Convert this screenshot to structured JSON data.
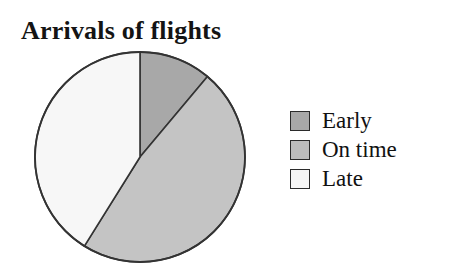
{
  "chart_data": {
    "type": "pie",
    "title": "Arrivals of flights",
    "xlabel": "",
    "ylabel": "",
    "legend_position": "right",
    "grid": false,
    "start_angle_deg": 0,
    "direction": "clockwise",
    "categories": [
      "Early",
      "On time",
      "Late"
    ],
    "values": [
      11,
      48,
      41
    ],
    "units": "percent",
    "slices": [
      {
        "label": "Early",
        "value": 11,
        "start_angle_deg": 0,
        "end_angle_deg": 40,
        "color": "#a8a8a8",
        "swatch_color": "#a8a8a8"
      },
      {
        "label": "On time",
        "value": 48,
        "start_angle_deg": 40,
        "end_angle_deg": 212,
        "color": "#c4c4c4",
        "swatch_color": "#bdbdbd"
      },
      {
        "label": "Late",
        "value": 41,
        "start_angle_deg": 212,
        "end_angle_deg": 360,
        "color": "#f7f7f7",
        "swatch_color": "#f5f5f5"
      }
    ],
    "outline_color": "#333333"
  },
  "title": {
    "text": "Arrivals of flights"
  },
  "legend": {
    "items": [
      {
        "label": "Early",
        "color": "#a8a8a8"
      },
      {
        "label": "On time",
        "color": "#bdbdbd"
      },
      {
        "label": "Late",
        "color": "#f5f5f5"
      }
    ]
  }
}
